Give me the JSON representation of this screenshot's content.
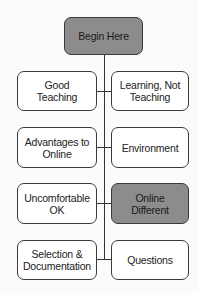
{
  "diagram": {
    "root": {
      "label": "Begin Here",
      "highlighted": true
    },
    "rows": [
      {
        "left": {
          "label": "Good\nTeaching",
          "highlighted": false
        },
        "right": {
          "label": "Learning, Not\nTeaching",
          "highlighted": false
        }
      },
      {
        "left": {
          "label": "Advantages to\nOnline",
          "highlighted": false
        },
        "right": {
          "label": "Environment",
          "highlighted": false
        }
      },
      {
        "left": {
          "label": "Uncomfortable\nOK",
          "highlighted": false
        },
        "right": {
          "label": "Online\nDifferent",
          "highlighted": true
        }
      },
      {
        "left": {
          "label": "Selection &\nDocumentation",
          "highlighted": false
        },
        "right": {
          "label": "Questions",
          "highlighted": false
        }
      }
    ],
    "colors": {
      "highlight_fill": "#8c8c8c",
      "box_fill": "#ffffff",
      "border": "#3a3a3a"
    }
  }
}
